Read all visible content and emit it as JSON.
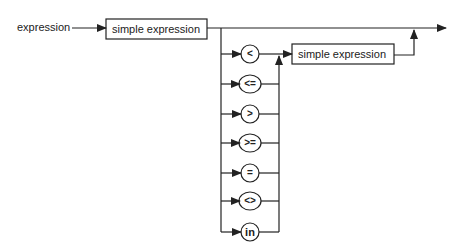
{
  "diagram": {
    "type": "syntax-diagram",
    "rule_name": "expression",
    "first_term": "simple expression",
    "second_term": "simple expression",
    "operators": [
      "<",
      "<=",
      ">",
      ">=",
      "=",
      "<>",
      "in"
    ],
    "colors": {
      "line": "#222222",
      "background": "#ffffff"
    }
  }
}
